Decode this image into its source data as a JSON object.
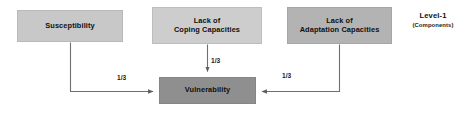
{
  "diagram": {
    "nodes": [
      {
        "id": "susceptibility",
        "label": "Susceptibility",
        "lines": [
          "Susceptibility"
        ],
        "fill": "#c8c8c8",
        "border": "#b9b9b9"
      },
      {
        "id": "coping",
        "label": "Lack of Coping Capacities",
        "line1": "Lack of",
        "line2": "Coping Capacities",
        "fill": "#cdcdcd",
        "border": "#bdbdbd"
      },
      {
        "id": "adaptation",
        "label": "Lack of Adaptation Capacities",
        "line1": "Lack of",
        "line2": "Adaptation Capacities",
        "fill": "#b3b3b3",
        "border": "#a6a6a6"
      },
      {
        "id": "vulnerability",
        "label": "Vulnerability",
        "fill": "#8f8f8f",
        "border": "#858585"
      }
    ],
    "edges": [
      {
        "id": "susceptibility-to-vulnerability",
        "from": "Susceptibility",
        "to": "Vulnerability",
        "weight": "1/3"
      },
      {
        "id": "coping-to-vulnerability",
        "from": "Lack of Coping Capacities",
        "to": "Vulnerability",
        "weight": "1/3"
      },
      {
        "id": "adaptation-to-vulnerability",
        "from": "Lack of Adaptation Capacities",
        "to": "Vulnerability",
        "weight": "1/3"
      }
    ],
    "legend": {
      "title": "Level-1",
      "subtitle": "(Components)"
    },
    "colors": {
      "connector": "#6f6f6f",
      "text": "#0f0f10",
      "background": "#ffffff"
    }
  }
}
